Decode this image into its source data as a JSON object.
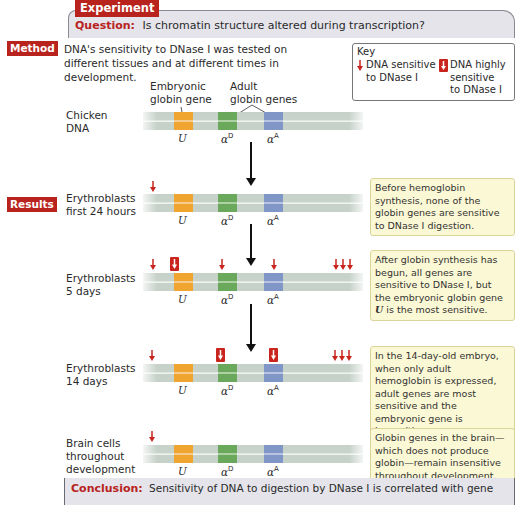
{
  "header": {
    "tab_label": "Experiment",
    "question_label": "Question:",
    "question_text": "Is chromatin structure altered during transcription?"
  },
  "method": {
    "tag": "Method",
    "text": "DNA's sensitivity to DNase I was tested on different tissues and at different times in development."
  },
  "key": {
    "title": "Key",
    "items": [
      {
        "icon": "small-red-arrow",
        "label_line1": "DNA sensitive",
        "label_line2": "to DNase I"
      },
      {
        "icon": "boxed-red-arrow",
        "label_line1": "DNA highly",
        "label_line2": "sensitive",
        "label_line3": "to DNase I"
      }
    ]
  },
  "gene_labels": {
    "embryonic_line1": "Embryonic",
    "embryonic_line2": "globin gene",
    "adult_line1": "Adult",
    "adult_line2": "globin genes",
    "genes": [
      {
        "name": "U",
        "sup": "",
        "color": "#f0a531"
      },
      {
        "name": "α",
        "sup": "D",
        "color": "#6aa95c"
      },
      {
        "name": "α",
        "sup": "A",
        "color": "#7f96c6"
      }
    ]
  },
  "results_tag": "Results",
  "rows": [
    {
      "label_line1": "Chicken",
      "label_line2": "DNA",
      "label_line3": "",
      "note": ""
    },
    {
      "label_line1": "Erythroblasts",
      "label_line2": "first 24 hours",
      "label_line3": "",
      "note": "Before hemoglobin synthesis, none of the globin genes are sensitive to DNase I digestion."
    },
    {
      "label_line1": "Erythroblasts",
      "label_line2": "5 days",
      "label_line3": "",
      "note_part1": "After globin synthesis has begun, all genes are sensitive to DNase I, but the embryonic globin gene ",
      "note_gene": "U",
      "note_part2": " is the most sensitive."
    },
    {
      "label_line1": "Erythroblasts",
      "label_line2": "14 days",
      "label_line3": "",
      "note": "In the 14-day-old embryo, when only adult hemoglobin is expressed, adult genes are most sensitive and the embryonic gene is insensitive."
    },
    {
      "label_line1": "Brain cells",
      "label_line2": "throughout",
      "label_line3": "development",
      "note": "Globin genes in the brain—which does not produce globin—remain insensitive throughout development."
    }
  ],
  "conclusion": {
    "label": "Conclusion:",
    "text": "Sensitivity of DNA to digestion by DNase I is correlated with gene"
  },
  "colors": {
    "accent_red": "#b8231e",
    "arrow_red": "#c9241d",
    "note_bg": "#fbf8d5",
    "panel_gray": "#e4e4ea"
  }
}
